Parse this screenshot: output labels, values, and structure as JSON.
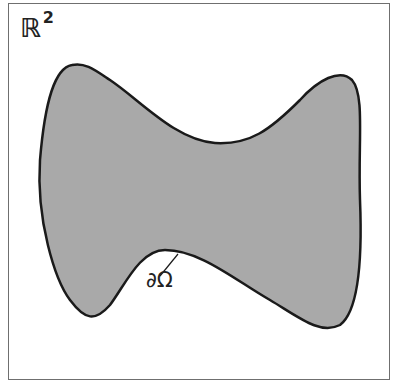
{
  "diagram": {
    "space": {
      "symbol": "ℝ",
      "exponent": "2"
    },
    "region": {
      "fill": "#a9a9a9",
      "stroke": "#1a1a1a"
    },
    "boundary_label": "∂Ω",
    "frame_color": "#6f6f6f"
  }
}
